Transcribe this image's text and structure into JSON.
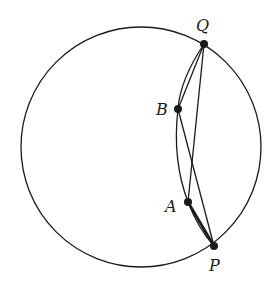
{
  "diagram": {
    "type": "geometry",
    "outer_circle": {
      "cx": 141,
      "cy": 147,
      "r": 120
    },
    "points": [
      {
        "name": "Q",
        "label": "Q",
        "x": 204,
        "y": 44,
        "label_x": 196,
        "label_y": 18
      },
      {
        "name": "B",
        "label": "B",
        "x": 178,
        "y": 109,
        "label_x": 156,
        "label_y": 102
      },
      {
        "name": "A",
        "label": "A",
        "x": 188,
        "y": 202,
        "label_x": 165,
        "label_y": 199
      },
      {
        "name": "P",
        "label": "P",
        "x": 214,
        "y": 246,
        "label_x": 209,
        "label_y": 258
      }
    ],
    "segments": [
      [
        "Q",
        "B"
      ],
      [
        "Q",
        "A"
      ],
      [
        "B",
        "P"
      ],
      [
        "A",
        "P"
      ]
    ],
    "inner_arc": [
      "Q",
      "B",
      "A",
      "P"
    ],
    "colors": {
      "stroke": "#1a1a1a",
      "background": "#ffffff"
    }
  }
}
